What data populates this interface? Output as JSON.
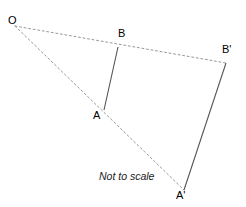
{
  "figure": {
    "caption": "Not to scale",
    "background_color": "#ffffff",
    "solid_line_color": "#555555",
    "dashed_line_color": "#999999",
    "label_color": "#000000",
    "labels": [
      {
        "name": "O",
        "text": "O",
        "x": 10,
        "y": 16
      },
      {
        "name": "B",
        "text": "B",
        "x": 119,
        "y": 28
      },
      {
        "name": "Bp",
        "text": "B'",
        "x": 223,
        "y": 45
      },
      {
        "name": "A",
        "text": "A",
        "x": 95,
        "y": 110
      },
      {
        "name": "Ap",
        "text": "A'",
        "x": 177,
        "y": 190
      }
    ],
    "points": {
      "O": {
        "x": 15,
        "y": 26
      },
      "A": {
        "x": 104,
        "y": 110
      },
      "B": {
        "x": 118,
        "y": 47
      },
      "Ap": {
        "x": 184,
        "y": 190
      },
      "Bp": {
        "x": 226,
        "y": 63
      }
    },
    "segments": [
      {
        "name": "segment-AB",
        "style": "solid",
        "from": "B",
        "to": "A"
      },
      {
        "name": "segment-ApBp",
        "style": "solid",
        "from": "Bp",
        "to": "Ap"
      },
      {
        "name": "ray-O-B-Bp",
        "style": "dashed",
        "from": "O",
        "to": "Bp"
      },
      {
        "name": "ray-O-A-Ap",
        "style": "dashed",
        "from": "O",
        "to": "Ap"
      }
    ]
  }
}
